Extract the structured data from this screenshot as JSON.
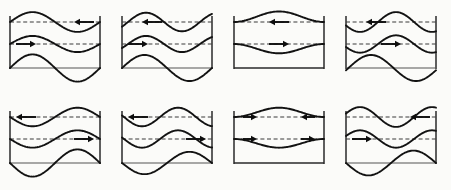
{
  "figure": {
    "rows": 2,
    "columns": 4,
    "panel_count": 8,
    "stroke_color": "#121212",
    "reference_line_color": "#3a3a3a",
    "frame_color": "#2a2a2a",
    "background_color": "#fbfbf9"
  },
  "chart_data": {
    "type": "line",
    "xlabel": "",
    "ylabel": "",
    "grid": false,
    "legend": "none",
    "xlim": [
      0,
      1
    ],
    "ylim": [
      0,
      1
    ],
    "panels": [
      {
        "index": 1,
        "row": 1,
        "column": 1,
        "upper_interface": {
          "shape": "sine",
          "cycles": 1,
          "amplitude": 0.16,
          "phase_deg": 180
        },
        "lower_interface": {
          "shape": "sine",
          "cycles": 1,
          "amplitude": 0.13,
          "phase_deg": 180
        },
        "bottom_interface": {
          "shape": "sine",
          "cycles": 1,
          "amplitude": 0.22,
          "phase_deg": 180,
          "present": true
        },
        "baseline": {
          "present": true,
          "style": "solid"
        },
        "reference_lines": 2,
        "arrows": [
          {
            "layer": "upper",
            "direction": "left",
            "position": "right"
          },
          {
            "layer": "lower",
            "direction": "right",
            "position": "left"
          }
        ]
      },
      {
        "index": 2,
        "row": 1,
        "column": 2,
        "upper_interface": {
          "shape": "sine",
          "cycles": 1.25,
          "amplitude": 0.15,
          "phase_deg": 150
        },
        "lower_interface": {
          "shape": "sine",
          "cycles": 1.25,
          "amplitude": 0.13,
          "phase_deg": 150
        },
        "bottom_interface": {
          "shape": "sine",
          "cycles": 1,
          "amplitude": 0.21,
          "phase_deg": 180,
          "present": true
        },
        "baseline": {
          "present": true,
          "style": "solid"
        },
        "reference_lines": 2,
        "arrows": [
          {
            "layer": "upper",
            "direction": "left",
            "position": "center-left"
          },
          {
            "layer": "lower",
            "direction": "right",
            "position": "left"
          }
        ]
      },
      {
        "index": 3,
        "row": 1,
        "column": 3,
        "upper_interface": {
          "shape": "bulge",
          "cycles": 1,
          "amplitude": 0.17,
          "phase_deg": 0
        },
        "lower_interface": {
          "shape": "bulge",
          "cycles": 1,
          "amplitude": 0.15,
          "phase_deg": 180
        },
        "bottom_interface": {
          "present": false
        },
        "baseline": {
          "present": true,
          "style": "solid-thick"
        },
        "reference_lines": 2,
        "arrows": [
          {
            "layer": "upper",
            "direction": "left",
            "position": "center"
          },
          {
            "layer": "lower",
            "direction": "right",
            "position": "center"
          }
        ]
      },
      {
        "index": 4,
        "row": 1,
        "column": 4,
        "upper_interface": {
          "shape": "sine",
          "cycles": 1.25,
          "amplitude": 0.16,
          "phase_deg": 20
        },
        "lower_interface": {
          "shape": "sine",
          "cycles": 1.25,
          "amplitude": 0.14,
          "phase_deg": 20
        },
        "bottom_interface": {
          "shape": "sine",
          "cycles": 1,
          "amplitude": 0.21,
          "phase_deg": 170,
          "present": true
        },
        "baseline": {
          "present": true,
          "style": "solid"
        },
        "reference_lines": 2,
        "arrows": [
          {
            "layer": "upper",
            "direction": "left",
            "position": "center-left"
          },
          {
            "layer": "lower",
            "direction": "right",
            "position": "center"
          }
        ]
      },
      {
        "index": 5,
        "row": 2,
        "column": 1,
        "upper_interface": {
          "shape": "sine",
          "cycles": 1,
          "amplitude": 0.15,
          "phase_deg": 0
        },
        "lower_interface": {
          "shape": "sine",
          "cycles": 1,
          "amplitude": 0.14,
          "phase_deg": 0
        },
        "bottom_interface": {
          "shape": "sine",
          "cycles": 1,
          "amplitude": 0.22,
          "phase_deg": 0,
          "present": true
        },
        "baseline": {
          "present": true,
          "style": "solid"
        },
        "reference_lines": 2,
        "arrows": [
          {
            "layer": "upper",
            "direction": "left",
            "position": "left"
          },
          {
            "layer": "lower",
            "direction": "right",
            "position": "right"
          }
        ]
      },
      {
        "index": 6,
        "row": 2,
        "column": 2,
        "upper_interface": {
          "shape": "sine",
          "cycles": 1.25,
          "amplitude": 0.15,
          "phase_deg": 350
        },
        "lower_interface": {
          "shape": "sine",
          "cycles": 1.25,
          "amplitude": 0.14,
          "phase_deg": 350
        },
        "bottom_interface": {
          "shape": "sine",
          "cycles": 1,
          "amplitude": 0.18,
          "phase_deg": 0,
          "present": true
        },
        "baseline": {
          "present": true,
          "style": "solid"
        },
        "reference_lines": 2,
        "arrows": [
          {
            "layer": "upper",
            "direction": "left",
            "position": "left"
          },
          {
            "layer": "lower",
            "direction": "right",
            "position": "right"
          }
        ]
      },
      {
        "index": 7,
        "row": 2,
        "column": 3,
        "upper_interface": {
          "shape": "pinch",
          "cycles": 1,
          "amplitude": 0.15,
          "phase_deg": 180
        },
        "lower_interface": {
          "shape": "pinch",
          "cycles": 1,
          "amplitude": 0.14,
          "phase_deg": 0
        },
        "bottom_interface": {
          "present": false
        },
        "baseline": {
          "present": true,
          "style": "solid-thick"
        },
        "reference_lines": 2,
        "arrows": [
          {
            "layer": "upper",
            "direction": "right",
            "position": "left"
          },
          {
            "layer": "upper",
            "direction": "left",
            "position": "right"
          },
          {
            "layer": "lower",
            "direction": "right",
            "position": "left"
          },
          {
            "layer": "lower",
            "direction": "right",
            "position": "right"
          }
        ]
      },
      {
        "index": 8,
        "row": 2,
        "column": 4,
        "upper_interface": {
          "shape": "sine",
          "cycles": 1.25,
          "amplitude": 0.16,
          "phase_deg": 200
        },
        "lower_interface": {
          "shape": "sine",
          "cycles": 1.25,
          "amplitude": 0.14,
          "phase_deg": 200
        },
        "bottom_interface": {
          "shape": "sine",
          "cycles": 1,
          "amplitude": 0.2,
          "phase_deg": 0,
          "present": true
        },
        "baseline": {
          "present": true,
          "style": "solid"
        },
        "reference_lines": 2,
        "arrows": [
          {
            "layer": "upper",
            "direction": "left",
            "position": "right"
          },
          {
            "layer": "lower",
            "direction": "right",
            "position": "left"
          }
        ]
      }
    ]
  }
}
